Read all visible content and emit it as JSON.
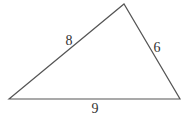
{
  "diagram": {
    "type": "triangle",
    "vertices": {
      "left": [
        9,
        99
      ],
      "top": [
        124,
        4
      ],
      "right": [
        180,
        99
      ]
    },
    "sides": [
      {
        "id": "left-top",
        "label": "8",
        "label_pos": [
          69,
          45
        ]
      },
      {
        "id": "top-right",
        "label": "6",
        "label_pos": [
          157,
          52
        ]
      },
      {
        "id": "left-right",
        "label": "9",
        "label_pos": [
          95,
          113
        ]
      }
    ],
    "stroke_color": "#555555",
    "label_color": "#333333"
  }
}
